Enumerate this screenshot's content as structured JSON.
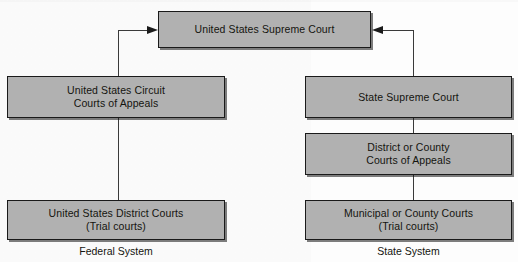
{
  "diagram": {
    "background_color": "#fdfdfd",
    "node_fill_color": "#b1b1b1",
    "node_border_color": "#1a1a1a",
    "text_color": "#14140f",
    "connector_color": "#3a3a3a"
  },
  "nodes": {
    "supreme_court": {
      "label": "United States Supreme Court"
    },
    "federal_appeals": {
      "label": "United States Circuit\nCourts of Appeals"
    },
    "federal_district": {
      "label": "United States District Courts\n(Trial courts)"
    },
    "state_supreme": {
      "label": "State Supreme Court"
    },
    "state_appeals": {
      "label": "District or County\nCourts of Appeals"
    },
    "state_trial": {
      "label": "Municipal or County Courts\n(Trial courts)"
    }
  },
  "captions": {
    "federal": "Federal System",
    "state": "State System"
  },
  "connectors": [
    {
      "name": "federal-appeals-to-supreme",
      "type": "elbow-arrow",
      "direction": "right"
    },
    {
      "name": "state-supreme-to-supreme",
      "type": "elbow-arrow",
      "direction": "left"
    },
    {
      "name": "federal-district-to-appeals",
      "type": "line"
    },
    {
      "name": "state-appeals-to-supreme",
      "type": "line"
    },
    {
      "name": "state-trial-to-appeals",
      "type": "line"
    }
  ]
}
